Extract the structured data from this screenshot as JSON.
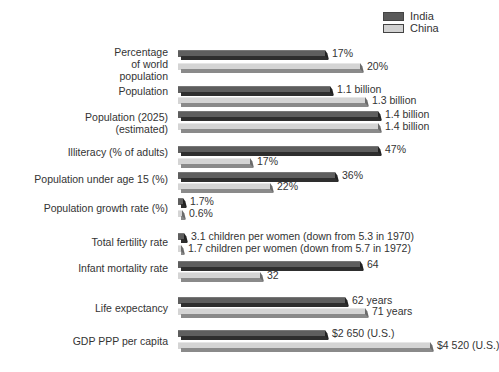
{
  "legend": [
    {
      "label": "India",
      "color": "#5a5a5a"
    },
    {
      "label": "China",
      "color": "#d2d2d2"
    }
  ],
  "colors": {
    "india_face": "#5e5e5e",
    "india_bottom": "#2e2e2e",
    "india_cap": "#222222",
    "china_face": "#d4d4d4",
    "china_bottom": "#8a8a8a",
    "china_cap": "#6a6a6a"
  },
  "chart_data": {
    "type": "bar",
    "orientation": "horizontal",
    "title": "",
    "legend": [
      "India",
      "China"
    ],
    "legend_position": "top-right",
    "grid": false,
    "categories": [
      "Percentage of world population",
      "Population",
      "Population (2025) (estimated)",
      "Illiteracy (% of adults)",
      "Population under age 15 (%)",
      "Population growth rate (%)",
      "Total fertility rate",
      "Infant mortality rate",
      "Life expectancy",
      "GDP PPP per capita"
    ],
    "series": [
      {
        "name": "India",
        "values": [
          17,
          1.1,
          1.4,
          47,
          36,
          1.7,
          3.1,
          64,
          62,
          2650
        ],
        "labels": [
          "17%",
          "1.1 billion",
          "1.4 billion",
          "47%",
          "36%",
          "1.7%",
          "3.1 children per women (down from 5.3 in 1970)",
          "64",
          "62 years",
          "$2 650 (U.S.)"
        ]
      },
      {
        "name": "China",
        "values": [
          20,
          1.3,
          1.4,
          17,
          22,
          0.6,
          1.7,
          32,
          71,
          4520
        ],
        "labels": [
          "20%",
          "1.3 billion",
          "1.4 billion",
          "17%",
          "22%",
          "0.6%",
          "1.7 children per women (down from 5.7 in 1972)",
          "32",
          "71 years",
          "$4 520 (U.S.)"
        ]
      }
    ]
  },
  "rows": [
    {
      "label": [
        "Percentage",
        "of world",
        "population"
      ],
      "label_top": 46,
      "india": {
        "top": 50,
        "end": 325,
        "text": "17%"
      },
      "china": {
        "top": 63,
        "end": 360,
        "text": "20%"
      }
    },
    {
      "label": [
        "Population"
      ],
      "label_top": 85,
      "india": {
        "top": 86,
        "end": 330,
        "text": "1.1 billion"
      },
      "china": {
        "top": 97,
        "end": 365,
        "text": "1.3 billion"
      }
    },
    {
      "label": [
        "Population (2025)",
        "(estimated)"
      ],
      "label_top": 111,
      "india": {
        "top": 111,
        "end": 378,
        "text": "1.4 billion"
      },
      "china": {
        "top": 123,
        "end": 378,
        "text": "1.4 billion"
      }
    },
    {
      "label": [
        "Illiteracy (% of adults)"
      ],
      "label_top": 146,
      "india": {
        "top": 146,
        "end": 378,
        "text": "47%"
      },
      "china": {
        "top": 158,
        "end": 250,
        "text": "17%"
      }
    },
    {
      "label": [
        "Population under age 15 (%)"
      ],
      "label_top": 173,
      "india": {
        "top": 172,
        "end": 335,
        "text": "36%"
      },
      "china": {
        "top": 183,
        "end": 270,
        "text": "22%"
      }
    },
    {
      "label": [
        "Population growth rate (%)"
      ],
      "label_top": 202,
      "india": {
        "top": 198,
        "end": 183,
        "text": "1.7%"
      },
      "china": {
        "top": 210,
        "end": 182,
        "text": "0.6%"
      }
    },
    {
      "label": [
        "Total fertility rate"
      ],
      "label_top": 236,
      "india": {
        "top": 233,
        "end": 184,
        "text": "3.1 children per women (down from 5.3 in 1970)"
      },
      "china": {
        "top": 245,
        "end": 181,
        "text": "1.7 children per women (down from 5.7 in 1972)"
      }
    },
    {
      "label": [
        "Infant mortality rate"
      ],
      "label_top": 262,
      "india": {
        "top": 261,
        "end": 360,
        "text": "64"
      },
      "china": {
        "top": 272,
        "end": 260,
        "text": "32"
      }
    },
    {
      "label": [
        "Life expectancy"
      ],
      "label_top": 302,
      "india": {
        "top": 297,
        "end": 345,
        "text": "62 years"
      },
      "china": {
        "top": 308,
        "end": 365,
        "text": "71 years"
      }
    },
    {
      "label": [
        "GDP PPP per capita"
      ],
      "label_top": 335,
      "india": {
        "top": 330,
        "end": 325,
        "text": "$2 650 (U.S.)"
      },
      "china": {
        "top": 342,
        "end": 430,
        "text": "$4 520 (U.S.)"
      }
    }
  ]
}
